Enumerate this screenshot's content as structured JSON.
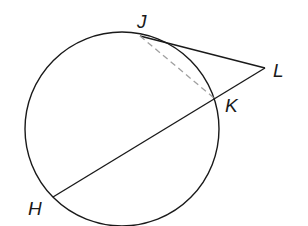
{
  "diagram": {
    "type": "geometry-circle-tangent-secant",
    "circle": {
      "cx": 122,
      "cy": 129,
      "r": 97,
      "stroke": "#1a1a1a"
    },
    "points": {
      "J": {
        "x": 140,
        "y": 36
      },
      "K": {
        "x": 214,
        "y": 98
      },
      "L": {
        "x": 265,
        "y": 68
      },
      "H": {
        "x": 53,
        "y": 197
      }
    },
    "segments": [
      {
        "name": "tangent-JL",
        "from": "J",
        "to": "L",
        "style": "solid"
      },
      {
        "name": "secant-LH",
        "from": "L",
        "to": "H",
        "style": "solid"
      },
      {
        "name": "chord-JK",
        "from": "J",
        "to": "K",
        "style": "dashed",
        "color": "#a0a0a0"
      }
    ],
    "labels": {
      "J": "J",
      "K": "K",
      "L": "L",
      "H": "H"
    }
  }
}
